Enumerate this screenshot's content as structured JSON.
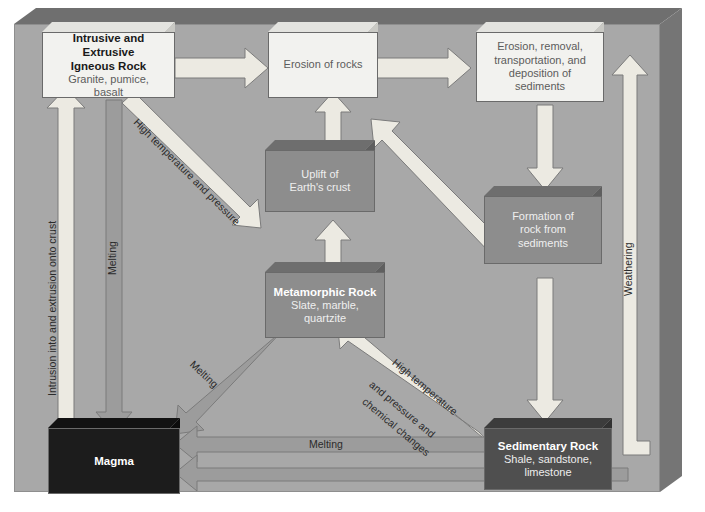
{
  "diagram": {
    "nodes": {
      "igneous": {
        "t1": "Intrusive and Extrusive",
        "t1b": "Igneous Rock",
        "t2": "Granite, pumice,",
        "t2b": "basalt"
      },
      "erosion": {
        "t1": "Erosion of rocks"
      },
      "erosion_dep": {
        "t1": "Erosion, removal,",
        "t1b": "transportation, and",
        "t2": "deposition of",
        "t2b": "sediments"
      },
      "uplift": {
        "t1": "Uplift of",
        "t1b": "Earth's crust"
      },
      "formation": {
        "t1": "Formation of",
        "t1b": "rock from",
        "t2": "sediments"
      },
      "metamorphic": {
        "t1": "Metamorphic Rock",
        "t2": "Slate, marble,",
        "t2b": "quartzite"
      },
      "sedimentary": {
        "t1": "Sedimentary Rock",
        "t2": "Shale, sandstone,",
        "t2b": "limestone"
      },
      "magma": {
        "t1": "Magma"
      }
    },
    "arrow_labels": {
      "intrusion": "Intrusion into and extrusion onto crust",
      "melting_left": "Melting",
      "high_temp_pressure": "High temperature and pressure",
      "melting_diag": "Melting",
      "melting_bottom": "Melting",
      "high_temp_chem_1": "High temperature",
      "high_temp_chem_2": "and pressure and",
      "high_temp_chem_3": "chemical changes",
      "weathering": "Weathering"
    },
    "colors": {
      "background": "#a8a8a8",
      "arrow_light": "#eceae2",
      "arrow_mid": "#9c9c9c",
      "node_light": "#f2f2ef",
      "node_mid": "#8d8d8d",
      "node_dark": "#4f4f4f",
      "node_black": "#1c1c1c"
    }
  }
}
